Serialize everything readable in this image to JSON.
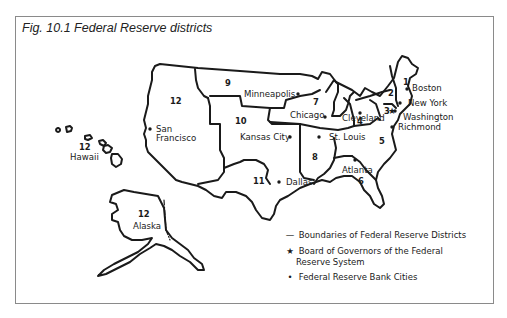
{
  "figure": {
    "caption": "Fig. 10.1  Federal Reserve districts"
  },
  "districts": [
    {
      "number": "1",
      "city": "Boston"
    },
    {
      "number": "2",
      "city": "New York"
    },
    {
      "number": "3",
      "city": "Philadelphia"
    },
    {
      "number": "4",
      "city": "Cleveland"
    },
    {
      "number": "5",
      "city": "Richmond"
    },
    {
      "number": "6",
      "city": "Atlanta"
    },
    {
      "number": "7",
      "city": "Chicago"
    },
    {
      "number": "8",
      "city": "St. Louis"
    },
    {
      "number": "9",
      "city": "Minneapolis"
    },
    {
      "number": "10",
      "city": "Kansas City"
    },
    {
      "number": "11",
      "city": "Dallas"
    },
    {
      "number": "12",
      "city": "San Francisco"
    }
  ],
  "labels": {
    "boston": "Boston",
    "new_york": "New York",
    "washington": "Washington",
    "richmond": "Richmond",
    "cleveland": "Cleveland",
    "chicago": "Chicago",
    "st_louis": "St. Louis",
    "atlanta": "Atlanta",
    "minneapolis": "Minneapolis",
    "kansas_city": "Kansas City",
    "dallas": "Dallas",
    "san": "San",
    "francisco": "Francisco",
    "hawaii": "Hawaii",
    "alaska": "Alaska"
  },
  "numbers": {
    "d1": "1",
    "d2": "2",
    "d3": "3",
    "d4": "4",
    "d5": "5",
    "d6": "6",
    "d7": "7",
    "d8": "8",
    "d9": "9",
    "d10": "10",
    "d11": "11",
    "d12_west": "12",
    "d12_hawaii": "12",
    "d12_alaska": "12"
  },
  "legend": {
    "boundary_symbol": "—",
    "boundary_label": "Boundaries of Federal Reserve Districts",
    "board_symbol": "★",
    "board_label_line1": "Board of Governors of the Federal",
    "board_label_line2": "Reserve System",
    "city_symbol": "•",
    "city_label": "Federal Reserve Bank Cities"
  }
}
